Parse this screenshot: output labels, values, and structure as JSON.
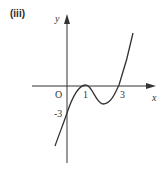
{
  "part_label": "(iii)",
  "axes": {
    "x_label": "x",
    "y_label": "y",
    "origin_label": "O",
    "x_ticks": [
      "1",
      "3"
    ],
    "y_ticks": [
      "-3"
    ]
  },
  "curve": {
    "description": "cubic with double root at x=1, root at x=3, y-intercept -3",
    "color": "#333333"
  },
  "colors": {
    "stroke": "#333333",
    "background": "#ffffff"
  }
}
